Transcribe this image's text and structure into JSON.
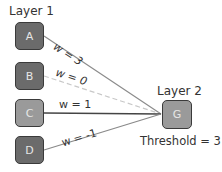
{
  "layer1": {
    "title": "Layer 1",
    "nodes": [
      {
        "id": "A",
        "label": "A",
        "shade": "dark"
      },
      {
        "id": "B",
        "label": "B",
        "shade": "dark"
      },
      {
        "id": "C",
        "label": "C",
        "shade": "light"
      },
      {
        "id": "D",
        "label": "D",
        "shade": "dark"
      }
    ]
  },
  "layer2": {
    "title": "Layer 2",
    "node": {
      "id": "G",
      "label": "G",
      "shade": "light"
    },
    "threshold_label": "Threshold = 3"
  },
  "edges": [
    {
      "from": "A",
      "to": "G",
      "weight_label": "w = 3",
      "style": "solid"
    },
    {
      "from": "B",
      "to": "G",
      "weight_label": "w = 0",
      "style": "dashed"
    },
    {
      "from": "C",
      "to": "G",
      "weight_label": "w = 1",
      "style": "solid-dark"
    },
    {
      "from": "D",
      "to": "G",
      "weight_label": "w = -1",
      "style": "solid"
    }
  ],
  "colors": {
    "node_dark": "#6b6b6b",
    "node_light": "#9a9a9a",
    "node_border": "#3a3a3a",
    "edge": "#8a8a8a",
    "edge_dashed": "#c8c8c8",
    "edge_dark": "#444444"
  }
}
